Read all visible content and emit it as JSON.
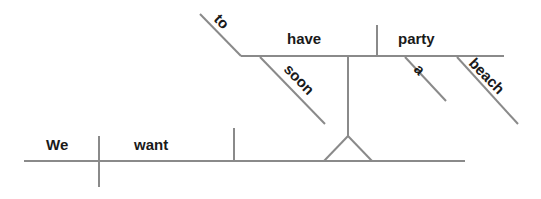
{
  "diagram": {
    "type": "sentence-diagram",
    "sentence": "We want to have a party at the beach soon",
    "line_color": "#8a8a8a",
    "text_color": "#1a1a1a",
    "main_clause": {
      "subject": "We",
      "verb": "want"
    },
    "infinitive_phrase": {
      "particle": "to",
      "verb": "have",
      "object": "party",
      "modifiers": {
        "verb_modifier": "soon",
        "object_article": "a",
        "object_modifier": "beach"
      }
    }
  }
}
